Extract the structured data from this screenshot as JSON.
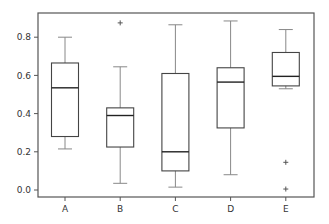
{
  "chart_data": {
    "type": "box",
    "title": "",
    "xlabel": "",
    "ylabel": "",
    "categories": [
      "A",
      "B",
      "C",
      "D",
      "E"
    ],
    "ylim": [
      -0.02,
      0.92
    ],
    "yticks": [
      0.0,
      0.2,
      0.4,
      0.6,
      0.8
    ],
    "ytick_labels": [
      "0.0",
      "0.2",
      "0.4",
      "0.6",
      "0.8"
    ],
    "grid": false,
    "legend": null,
    "boxes": [
      {
        "label": "A",
        "whislo": 0.215,
        "q1": 0.28,
        "med": 0.535,
        "q3": 0.665,
        "whishi": 0.8,
        "fliers": []
      },
      {
        "label": "B",
        "whislo": 0.035,
        "q1": 0.225,
        "med": 0.39,
        "q3": 0.43,
        "whishi": 0.645,
        "fliers": [
          0.875
        ]
      },
      {
        "label": "C",
        "whislo": 0.015,
        "q1": 0.1,
        "med": 0.2,
        "q3": 0.61,
        "whishi": 0.865,
        "fliers": []
      },
      {
        "label": "D",
        "whislo": 0.08,
        "q1": 0.325,
        "med": 0.565,
        "q3": 0.64,
        "whishi": 0.885,
        "fliers": []
      },
      {
        "label": "E",
        "whislo": 0.53,
        "q1": 0.545,
        "med": 0.595,
        "q3": 0.72,
        "whishi": 0.84,
        "fliers": [
          0.145,
          0.005
        ]
      }
    ]
  },
  "style": {
    "axis_color": "#555555",
    "box_color": "#444444",
    "whisker_color": "#888888",
    "median_color": "#222222",
    "flier_color": "#555555",
    "background": "#ffffff"
  }
}
